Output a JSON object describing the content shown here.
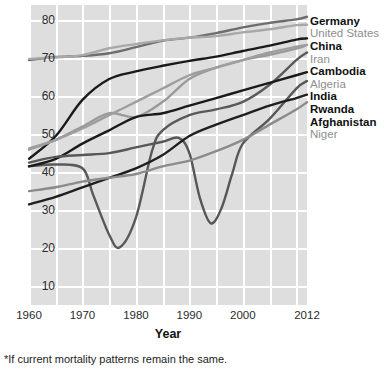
{
  "chart_data": {
    "type": "line",
    "title": "",
    "xlabel": "Year",
    "ylabel": "",
    "footnote": "*If current mortality patterns remain the same.",
    "xlim": [
      1960,
      2012
    ],
    "ylim": [
      5,
      84
    ],
    "grid": true,
    "legend_position": "right",
    "xticks": [
      "1960",
      "1970",
      "1980",
      "1990",
      "2000",
      "2012"
    ],
    "xtick_values": [
      1960,
      1970,
      1980,
      1990,
      2000,
      2012
    ],
    "yticks": [
      "10",
      "20",
      "30",
      "40",
      "50",
      "60",
      "70",
      "80"
    ],
    "ytick_values": [
      10,
      20,
      30,
      40,
      50,
      60,
      70,
      80
    ],
    "series": [
      {
        "name": "Germany",
        "color": "#6d6d6d",
        "emphasis": "bold",
        "x": [
          1960,
          1965,
          1970,
          1975,
          1980,
          1985,
          1990,
          1995,
          2000,
          2005,
          2010,
          2012
        ],
        "values": [
          69.5,
          70.3,
          70.6,
          71.3,
          72.9,
          74.6,
          75.4,
          76.6,
          78.1,
          79.3,
          80.2,
          80.9
        ]
      },
      {
        "name": "United States",
        "color": "#a8a8a8",
        "emphasis": "grey",
        "x": [
          1960,
          1965,
          1970,
          1975,
          1980,
          1985,
          1990,
          1995,
          2000,
          2005,
          2010,
          2012
        ],
        "values": [
          69.8,
          70.2,
          70.8,
          72.6,
          73.7,
          74.7,
          75.4,
          75.8,
          76.8,
          77.6,
          78.7,
          78.8
        ]
      },
      {
        "name": "China",
        "color": "#1a1a1a",
        "emphasis": "bold",
        "x": [
          1960,
          1965,
          1970,
          1975,
          1980,
          1985,
          1990,
          1995,
          2000,
          2005,
          2010,
          2012
        ],
        "values": [
          43.5,
          49.5,
          59.0,
          64.5,
          66.5,
          68.0,
          69.3,
          70.4,
          71.9,
          73.3,
          74.9,
          75.2
        ]
      },
      {
        "name": "Iran",
        "color": "#9a9a9a",
        "emphasis": "grey",
        "x": [
          1960,
          1965,
          1970,
          1975,
          1980,
          1985,
          1990,
          1995,
          2000,
          2005,
          2010,
          2012
        ],
        "values": [
          45.9,
          48.5,
          52.0,
          55.5,
          54.5,
          58.5,
          64.5,
          67.5,
          69.5,
          70.9,
          72.5,
          73.5
        ]
      },
      {
        "name": "Cambodia",
        "color": "#595959",
        "emphasis": "bold",
        "x": [
          1960,
          1965,
          1970,
          1972,
          1975,
          1977,
          1980,
          1983,
          1985,
          1990,
          1995,
          2000,
          2005,
          2010,
          2012
        ],
        "values": [
          41.5,
          42.0,
          41.0,
          34.0,
          23.5,
          20.2,
          28.0,
          45.5,
          51.0,
          55.0,
          56.5,
          58.5,
          63.0,
          69.5,
          71.5
        ]
      },
      {
        "name": "Algeria",
        "color": "#9e9e9e",
        "emphasis": "grey",
        "x": [
          1960,
          1965,
          1970,
          1975,
          1980,
          1985,
          1990,
          1995,
          2000,
          2005,
          2010,
          2012
        ],
        "values": [
          46.2,
          48.5,
          51.5,
          55.0,
          58.5,
          62.0,
          65.5,
          67.5,
          69.5,
          71.5,
          73.0,
          73.5
        ]
      },
      {
        "name": "India",
        "color": "#1a1a1a",
        "emphasis": "bold",
        "x": [
          1960,
          1965,
          1970,
          1975,
          1980,
          1985,
          1990,
          1995,
          2000,
          2005,
          2010,
          2012
        ],
        "values": [
          41.5,
          43.5,
          47.5,
          51.0,
          54.5,
          55.5,
          57.5,
          59.5,
          61.5,
          63.5,
          65.5,
          66.3
        ]
      },
      {
        "name": "Rwanda",
        "color": "#575757",
        "emphasis": "bold",
        "x": [
          1960,
          1965,
          1970,
          1975,
          1980,
          1985,
          1988,
          1990,
          1992,
          1994,
          1996,
          1998,
          2000,
          2005,
          2010,
          2012
        ],
        "values": [
          42.5,
          44.0,
          44.5,
          45.0,
          46.5,
          48.0,
          49.0,
          45.0,
          33.0,
          26.5,
          30.5,
          39.5,
          47.5,
          54.0,
          62.0,
          64.0
        ]
      },
      {
        "name": "Afghanistan",
        "color": "#1f1f1f",
        "emphasis": "bold",
        "x": [
          1960,
          1965,
          1970,
          1975,
          1980,
          1985,
          1990,
          1995,
          2000,
          2005,
          2010,
          2012
        ],
        "values": [
          31.5,
          33.5,
          36.0,
          38.5,
          41.0,
          44.5,
          49.5,
          52.5,
          55.0,
          57.5,
          59.5,
          60.4
        ]
      },
      {
        "name": "Niger",
        "color": "#8b8b8b",
        "emphasis": "grey",
        "x": [
          1960,
          1965,
          1970,
          1975,
          1980,
          1985,
          1990,
          1995,
          2000,
          2005,
          2010,
          2012
        ],
        "values": [
          35.0,
          36.0,
          37.5,
          38.5,
          39.5,
          41.5,
          43.0,
          45.5,
          48.5,
          52.5,
          56.5,
          58.4
        ]
      }
    ]
  },
  "axes": {
    "x_title": "Year",
    "footnote": "*If current mortality patterns remain the same."
  },
  "legend": {
    "entries": [
      {
        "label": "Germany"
      },
      {
        "label": "United States"
      },
      {
        "label": "China"
      },
      {
        "label": "Iran"
      },
      {
        "label": "Cambodia"
      },
      {
        "label": "Algeria"
      },
      {
        "label": "India"
      },
      {
        "label": "Rwanda"
      },
      {
        "label": "Afghanistan"
      },
      {
        "label": "Niger"
      }
    ]
  },
  "colors": {
    "plot_background": "#dedede",
    "grid": "#ffffff",
    "page_background": "#ffffff",
    "text": "#1a1a1a",
    "muted_text": "#8e8e8e"
  }
}
